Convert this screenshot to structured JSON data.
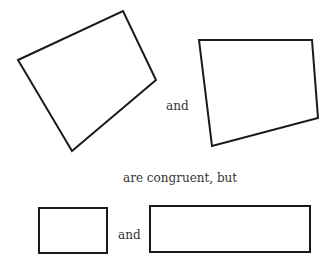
{
  "labels": {
    "and_top": "and",
    "middle": "are congruent, but",
    "and_bottom": "and"
  },
  "shapes": {
    "quad_left": "18,60 123,11 156,80 72,151",
    "quad_right": "199,40 312,40 318,118 212,146",
    "rect_small": {
      "x": 39,
      "y": 208,
      "w": 68,
      "h": 45
    },
    "rect_large": {
      "x": 150,
      "y": 206,
      "w": 160,
      "h": 46
    }
  },
  "colors": {
    "stroke": "#1a1a1a",
    "text": "#333333"
  }
}
